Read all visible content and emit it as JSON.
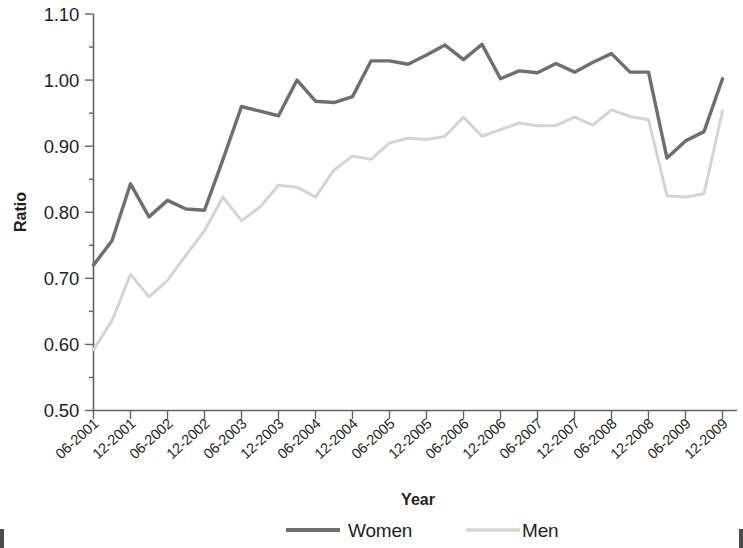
{
  "chart_data": {
    "type": "line",
    "title": "",
    "xlabel": "Year",
    "ylabel": "Ratio",
    "ylim": [
      0.5,
      1.1
    ],
    "ytick_labels": [
      "0.50",
      "0.60",
      "0.70",
      "0.80",
      "0.90",
      "1.00",
      "1.10"
    ],
    "ytick_values": [
      0.5,
      0.6,
      0.7,
      0.8,
      0.9,
      1.0,
      1.1
    ],
    "grid": false,
    "legend_position": "bottom",
    "categories": [
      "06-2001",
      "09-2001",
      "12-2001",
      "03-2002",
      "06-2002",
      "09-2002",
      "12-2002",
      "03-2003",
      "06-2003",
      "09-2003",
      "12-2003",
      "03-2004",
      "06-2004",
      "09-2004",
      "12-2004",
      "03-2005",
      "06-2005",
      "09-2005",
      "12-2005",
      "03-2006",
      "06-2006",
      "09-2006",
      "12-2006",
      "03-2007",
      "06-2007",
      "09-2007",
      "12-2007",
      "03-2008",
      "06-2008",
      "09-2008",
      "12-2008",
      "03-2009",
      "06-2009",
      "09-2009",
      "12-2009"
    ],
    "xtick_labels": [
      "06-2001",
      "12-2001",
      "06-2002",
      "12-2002",
      "06-2003",
      "12-2003",
      "06-2004",
      "12-2004",
      "06-2005",
      "12-2005",
      "06-2006",
      "12-2006",
      "06-2007",
      "12-2007",
      "06-2008",
      "12-2008",
      "06-2009",
      "12-2009"
    ],
    "series": [
      {
        "name": "Women",
        "color": "#6e6e6e",
        "line_width": 3.4,
        "values": [
          0.72,
          0.757,
          0.843,
          0.793,
          0.818,
          0.805,
          0.803,
          0.88,
          0.96,
          0.953,
          0.946,
          1.0,
          0.968,
          0.966,
          0.975,
          1.029,
          1.029,
          1.024,
          1.038,
          1.053,
          1.031,
          1.054,
          1.002,
          1.014,
          1.011,
          1.025,
          1.012,
          1.027,
          1.04,
          1.012,
          1.012,
          0.882,
          0.908,
          0.922,
          1.002
        ]
      },
      {
        "name": "Men",
        "color": "#d4d4d4",
        "line_width": 3.0,
        "values": [
          0.592,
          0.636,
          0.706,
          0.672,
          0.697,
          0.735,
          0.772,
          0.823,
          0.787,
          0.808,
          0.841,
          0.838,
          0.823,
          0.864,
          0.885,
          0.88,
          0.905,
          0.912,
          0.91,
          0.915,
          0.944,
          0.915,
          0.925,
          0.935,
          0.931,
          0.931,
          0.944,
          0.932,
          0.955,
          0.945,
          0.94,
          0.825,
          0.823,
          0.828,
          0.953
        ]
      }
    ]
  },
  "axis": {
    "y_title": "Ratio",
    "x_title": "Year"
  },
  "legend": {
    "items": [
      {
        "label": "Women",
        "color": "#6e6e6e"
      },
      {
        "label": "Men",
        "color": "#d4d4d4"
      }
    ]
  }
}
